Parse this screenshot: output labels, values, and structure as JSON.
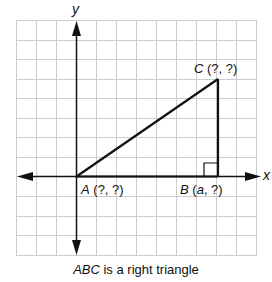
{
  "figure": {
    "x_axis_label": "x",
    "y_axis_label": "y",
    "grid": {
      "columns": 12,
      "rows": 12,
      "color": "#c8c8c8"
    },
    "triangle": {
      "stroke": "#111111"
    },
    "points": {
      "A": {
        "name": "A",
        "coords": "(?, ?)"
      },
      "B": {
        "name": "B",
        "coords_open": "(",
        "coords_var": "a",
        "coords_rest": ", ?)"
      },
      "C": {
        "name": "C",
        "coords": "(?, ?)"
      }
    },
    "right_angle_at": "B"
  },
  "caption": {
    "italic_part": "ABC",
    "rest": " is a right triangle"
  }
}
